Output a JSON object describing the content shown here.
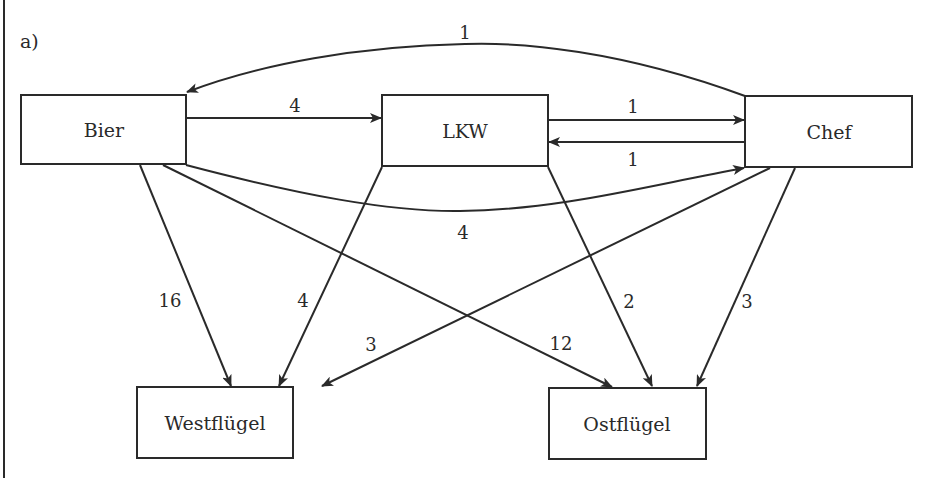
{
  "part_label": "a)",
  "nodes": [
    {
      "id": "bier",
      "label": "Bier"
    },
    {
      "id": "lkw",
      "label": "LKW"
    },
    {
      "id": "chef",
      "label": "Chef"
    },
    {
      "id": "westfluegel",
      "label": "Westflügel"
    },
    {
      "id": "ostfluegel",
      "label": "Ostflügel"
    }
  ],
  "edges": [
    {
      "from": "chef",
      "to": "bier",
      "weight": "1"
    },
    {
      "from": "bier",
      "to": "lkw",
      "weight": "4"
    },
    {
      "from": "lkw",
      "to": "chef",
      "weight": "1"
    },
    {
      "from": "chef",
      "to": "lkw",
      "weight": "1"
    },
    {
      "from": "bier",
      "to": "chef",
      "weight": "4"
    },
    {
      "from": "bier",
      "to": "westfluegel",
      "weight": "16"
    },
    {
      "from": "bier",
      "to": "ostfluegel",
      "weight": "12"
    },
    {
      "from": "lkw",
      "to": "westfluegel",
      "weight": "4"
    },
    {
      "from": "lkw",
      "to": "ostfluegel",
      "weight": "2"
    },
    {
      "from": "chef",
      "to": "westfluegel",
      "weight": "3"
    },
    {
      "from": "chef",
      "to": "ostfluegel",
      "weight": "3"
    }
  ],
  "colors": {
    "stroke": "#2a2a2a",
    "background": "#ffffff"
  }
}
